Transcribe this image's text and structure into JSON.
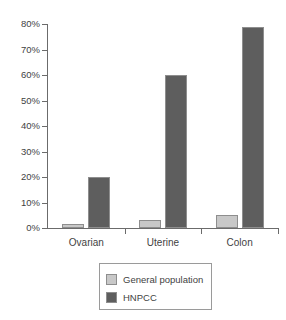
{
  "chart_data": {
    "type": "bar",
    "title": "",
    "subtitle": "",
    "xlabel": "",
    "ylabel": "",
    "categories": [
      "Ovarian",
      "Uterine",
      "Colon"
    ],
    "series": [
      {
        "name": "General population",
        "values": [
          1.5,
          3,
          5
        ],
        "color": "#c8c8c8"
      },
      {
        "name": "HNPCC",
        "values": [
          20,
          60,
          79
        ],
        "color": "#5e5e5e"
      }
    ],
    "ylim": [
      0,
      80
    ],
    "ytick_values": [
      0,
      10,
      20,
      30,
      40,
      50,
      60,
      70,
      80
    ],
    "ytick_labels": [
      "0%",
      "10%",
      "20%",
      "30%",
      "40%",
      "50%",
      "60%",
      "70%",
      "80%"
    ],
    "grid": false,
    "legend_position": "bottom",
    "value_suffix": "%"
  },
  "legend": {
    "entries": [
      {
        "label": "General population",
        "swatch": "legend-swatch-general-population"
      },
      {
        "label": "HNPCC",
        "swatch": "legend-swatch-hnpcc"
      }
    ]
  },
  "axes": {
    "y_axis_name": "percentage-axis",
    "x_axis_name": "category-axis"
  }
}
